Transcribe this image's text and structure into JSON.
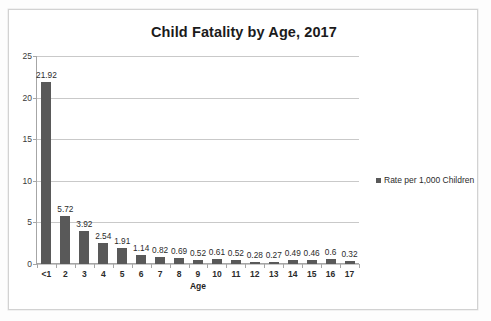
{
  "chart_data": {
    "type": "bar",
    "title": "Child Fatality by Age, 2017",
    "xlabel": "Age",
    "ylabel": "",
    "categories": [
      "<1",
      "2",
      "3",
      "4",
      "5",
      "6",
      "7",
      "8",
      "9",
      "10",
      "11",
      "12",
      "13",
      "14",
      "15",
      "16",
      "17"
    ],
    "values": [
      21.92,
      5.72,
      3.92,
      2.54,
      1.91,
      1.14,
      0.82,
      0.69,
      0.52,
      0.61,
      0.52,
      0.28,
      0.27,
      0.49,
      0.46,
      0.6,
      0.32
    ],
    "value_labels": [
      "21.92",
      "5.72",
      "3.92",
      "2.54",
      "1.91",
      "1.14",
      "0.82",
      "0.69",
      "0.52",
      "0.61",
      "0.52",
      "0.28",
      "0.27",
      "0.49",
      "0.46",
      "0.6",
      "0.32"
    ],
    "series": [
      {
        "name": "Rate per 1,000 Children",
        "color": "#595959",
        "values": [
          21.92,
          5.72,
          3.92,
          2.54,
          1.91,
          1.14,
          0.82,
          0.69,
          0.52,
          0.61,
          0.52,
          0.28,
          0.27,
          0.49,
          0.46,
          0.6,
          0.32
        ]
      }
    ],
    "ylim": [
      0,
      25
    ],
    "y_ticks": [
      0,
      5,
      10,
      15,
      20,
      25
    ],
    "y_tick_labels": [
      "0",
      "5",
      "10",
      "15",
      "20",
      "25"
    ],
    "grid": true,
    "grid_color": "#c9c9c9",
    "legend": {
      "position": "right",
      "entries": [
        {
          "label": "Rate per 1,000 Children",
          "color": "#595959",
          "marker": "square"
        }
      ]
    },
    "bar_color": "#595959",
    "data_labels_shown": true
  },
  "colors": {
    "bar": "#595959",
    "grid": "#c9c9c9",
    "axis": "#a6a6a6",
    "frame_border": "#d2d2d2",
    "text": "#2b2b2b",
    "page_background": "#fdfdfd",
    "chart_background": "#ffffff"
  }
}
